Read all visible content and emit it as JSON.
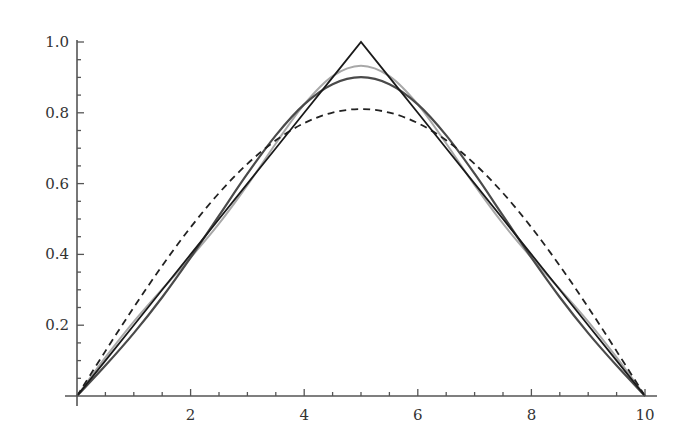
{
  "chart_data": {
    "type": "line",
    "title": "",
    "xlabel": "",
    "ylabel": "",
    "xlim": [
      0,
      10
    ],
    "ylim": [
      0,
      1.0
    ],
    "grid": false,
    "legend": null,
    "x_ticks": [
      2,
      4,
      6,
      8,
      10
    ],
    "x_tick_labels": [
      "2",
      "4",
      "6",
      "8",
      "10"
    ],
    "x_minor_step": 0.5,
    "y_ticks": [
      0.2,
      0.4,
      0.6,
      0.8,
      1.0
    ],
    "y_tick_labels": [
      "0.2",
      "0.4",
      "0.6",
      "0.8",
      "1.0"
    ],
    "y_minor_step": 0.05,
    "x": [
      0,
      0.5,
      1,
      1.5,
      2,
      2.5,
      3,
      3.5,
      4,
      4.5,
      5,
      5.5,
      6,
      6.5,
      7,
      7.5,
      8,
      8.5,
      9,
      9.5,
      10
    ],
    "series": [
      {
        "name": "triangle",
        "color": "#1a1a1a",
        "style": "solid",
        "width": 1.8,
        "values": [
          0,
          0.1,
          0.2,
          0.3,
          0.4,
          0.5,
          0.6,
          0.7,
          0.8,
          0.9,
          1.0,
          0.9,
          0.8,
          0.7,
          0.6,
          0.5,
          0.4,
          0.3,
          0.2,
          0.1,
          0
        ]
      },
      {
        "name": "1-term approximation",
        "color": "#222222",
        "style": "dashed",
        "width": 1.8,
        "values": [
          0,
          0.1268,
          0.2505,
          0.368,
          0.4764,
          0.5732,
          0.6558,
          0.7222,
          0.7709,
          0.8006,
          0.8106,
          0.8006,
          0.7709,
          0.7222,
          0.6558,
          0.5732,
          0.4764,
          0.368,
          0.2505,
          0.1268,
          0
        ]
      },
      {
        "name": "2-term approximation",
        "color": "#4a4a4a",
        "style": "solid",
        "width": 2.2,
        "values": [
          0,
          0.0859,
          0.1776,
          0.279,
          0.3908,
          0.5095,
          0.6279,
          0.7363,
          0.8238,
          0.8808,
          0.9006,
          0.8808,
          0.8238,
          0.7363,
          0.6279,
          0.5095,
          0.3908,
          0.279,
          0.1776,
          0.0859,
          0
        ]
      },
      {
        "name": "3-term approximation",
        "color": "#a8a8a8",
        "style": "solid",
        "width": 2.0,
        "values": [
          0,
          0.1088,
          0.21,
          0.3019,
          0.3908,
          0.4866,
          0.5955,
          0.7134,
          0.8238,
          0.9037,
          0.933,
          0.9037,
          0.8238,
          0.7134,
          0.5955,
          0.4866,
          0.3908,
          0.3019,
          0.21,
          0.1088,
          0
        ]
      }
    ],
    "plot_area_px": {
      "x0": 77,
      "x10": 645,
      "y0": 396,
      "y1": 42
    }
  }
}
